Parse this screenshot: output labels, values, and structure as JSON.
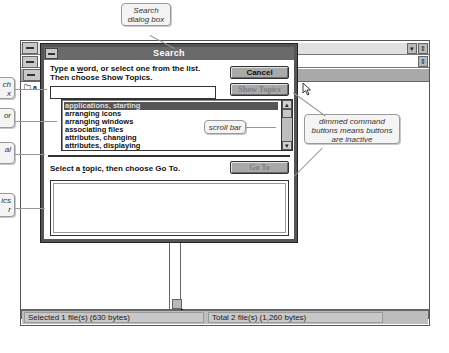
{
  "callouts": {
    "search_dialog": "Search dialog box",
    "search_box": "ch\nx",
    "list_for": "or",
    "horizontal": "al",
    "topics_list": "ics\nr",
    "scroll_bar": "scroll bar",
    "dimmed_buttons": "dimmed command buttons means buttons are inactive"
  },
  "dialog": {
    "title": "Search",
    "instruction_line1_pre": "Type a ",
    "instruction_line1_ul": "w",
    "instruction_line1_post": "ord, or select one from the list.",
    "instruction_line2": "Then choose Show Topics.",
    "search_value": "",
    "cancel_label": "Cancel",
    "show_topics_label": "Show Topics",
    "list_items": [
      "applications, starting",
      "arranging icons",
      "arranging windows",
      "associating files",
      "attributes, changing",
      "attributes, displaying"
    ],
    "selected_index": 0,
    "topic_prompt_pre": "Select a ",
    "topic_prompt_ul": "t",
    "topic_prompt_post": "opic, then choose Go To.",
    "go_to_label": "Go To"
  },
  "file_manager": {
    "folder_label": "a",
    "status_left": "Selected 1 file(s) (630 bytes)",
    "status_right": "Total 2 file(s) (1,260 bytes)"
  },
  "colors": {
    "title_bar": "#6a6a6a",
    "button_face": "#a9a9a9",
    "selected_item": "#555555",
    "status_bar": "#bdbdbd"
  }
}
